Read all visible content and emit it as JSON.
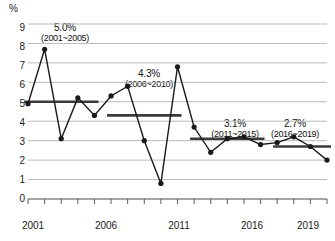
{
  "axis": {
    "unit": "%",
    "y_ticks": [
      "9",
      "8",
      "7",
      "6",
      "5",
      "4",
      "3",
      "2",
      "1",
      "0"
    ],
    "x_ticks": [
      "2001",
      "2006",
      "2011",
      "2016",
      "2019"
    ]
  },
  "annotations": [
    {
      "value": "5.0%",
      "range": "(2001~2005)"
    },
    {
      "value": "4.3%",
      "range": "(2006~2010)"
    },
    {
      "value": "3.1%",
      "range": "(2011~2015)"
    },
    {
      "value": "2.7%",
      "range": "(2016~2019)"
    }
  ],
  "colors": {
    "line": "#1a1a1a",
    "marker": "#1a1a1a",
    "grid": "#b9b9b9",
    "average_bar": "#3b3b3b",
    "text": "#1a1a1a",
    "background": "#ffffff"
  },
  "chart_data": {
    "type": "line",
    "title": "",
    "subtitle": "",
    "xlabel": "",
    "ylabel": "%",
    "ylim": [
      0,
      9
    ],
    "xlim": [
      2001,
      2019
    ],
    "grid": true,
    "legend": "none",
    "x": [
      2001,
      2002,
      2003,
      2004,
      2005,
      2006,
      2007,
      2008,
      2009,
      2010,
      2011,
      2012,
      2013,
      2014,
      2015,
      2016,
      2017,
      2018,
      2019
    ],
    "series": [
      {
        "name": "annual rate",
        "values": [
          4.9,
          7.7,
          3.1,
          5.2,
          4.3,
          5.3,
          5.8,
          3.0,
          0.8,
          6.8,
          3.7,
          2.4,
          3.1,
          3.2,
          2.8,
          2.9,
          3.2,
          2.7,
          2.0
        ]
      }
    ],
    "period_averages": [
      {
        "label": "5.0%",
        "range": "(2001~2005)",
        "start_year": 2001,
        "end_year": 2005,
        "value": 5.0
      },
      {
        "label": "4.3%",
        "range": "(2006~2010)",
        "start_year": 2006,
        "end_year": 2010,
        "value": 4.3
      },
      {
        "label": "3.1%",
        "range": "(2011~2015)",
        "start_year": 2011,
        "end_year": 2015,
        "value": 3.1
      },
      {
        "label": "2.7%",
        "range": "(2016~2019)",
        "start_year": 2016,
        "end_year": 2019,
        "value": 2.7
      }
    ],
    "axis_tick_labels": {
      "y": [
        "0",
        "1",
        "2",
        "3",
        "4",
        "5",
        "6",
        "7",
        "8",
        "9"
      ],
      "x": [
        "2001",
        "2006",
        "2011",
        "2016",
        "2019"
      ]
    }
  }
}
